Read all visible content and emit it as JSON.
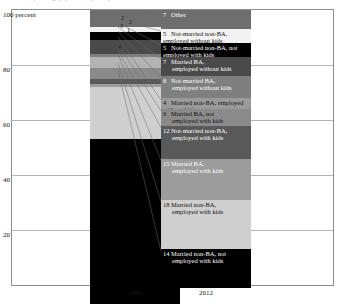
{
  "title_cropped": "Share of prime-age population, by family and work status",
  "axis": {
    "y_top_label": "100 percent",
    "y_ticks": [
      {
        "value": 100,
        "label": "100 percent"
      },
      {
        "value": 80,
        "label": "80"
      },
      {
        "value": 60,
        "label": "60"
      },
      {
        "value": 40,
        "label": "40"
      },
      {
        "value": 20,
        "label": "20"
      }
    ],
    "x_categories": [
      "1960",
      "2012"
    ]
  },
  "colors": {
    "black": "#000000",
    "dark_gray": "#3f3f3f",
    "mid_dark_gray": "#595959",
    "mid_gray": "#6e6e6e",
    "gray": "#8a8a8a",
    "light_gray": "#b3b3b3",
    "lighter_gray": "#c8c8c8",
    "pale_gray": "#d6d6d6",
    "white": "#f2f2f2",
    "frame": "#8d8d8d",
    "grid": "#b6b6b6",
    "leader": "#6b6b6b"
  },
  "chart_data": {
    "type": "bar",
    "subtype": "stacked-100-percent",
    "title": "Share of prime-age population, by family and work status",
    "xlabel": "",
    "ylabel": "percent",
    "ylim": [
      0,
      100
    ],
    "grid": true,
    "legend": "inline-labels",
    "categories": [
      "1960",
      "2012"
    ],
    "series": [
      {
        "name": "Other",
        "values": [
          6,
          7
        ]
      },
      {
        "name": "Not-married non-BA, employed without kids",
        "values": [
          2,
          5
        ]
      },
      {
        "name": "Not-married non-BA, not employed with kids",
        "values": [
          3,
          5
        ]
      },
      {
        "name": "Married BA, employed without kids",
        "values": [
          5,
          7
        ]
      },
      {
        "name": "Not-married BA, employed without kids",
        "values": [
          1,
          8
        ]
      },
      {
        "name": "Married non-BA, employed without kids",
        "values": [
          4,
          4
        ]
      },
      {
        "name": "Married BA, not employed with kids",
        "values": [
          4,
          6
        ]
      },
      {
        "name": "Not-married non-BA, employed with kids",
        "values": [
          2,
          12
        ]
      },
      {
        "name": "Married BA, employed with kids",
        "values": [
          1,
          15
        ]
      },
      {
        "name": "Married non-BA, employed with kids",
        "values": [
          19,
          18
        ]
      },
      {
        "name": "Married non-BA, not employed with kids",
        "values": [
          60,
          14
        ]
      }
    ]
  },
  "bars": {
    "b1960": {
      "year": "1960",
      "segments": [
        {
          "id": "other-1960",
          "value": 6,
          "label": "6",
          "color": "#6e6e6e"
        },
        {
          "id": "nm-nonba-emp-nokids-1960",
          "value": 2,
          "label": "2",
          "color": "#f2f2f2"
        },
        {
          "id": "nm-nonba-notemp-kids-1960",
          "value": 3,
          "label": "3",
          "color": "#000000"
        },
        {
          "id": "m-ba-emp-nokids-1960",
          "value": 5,
          "label": "5",
          "color": "#4a4a4a"
        },
        {
          "id": "nm-ba-emp-nokids-1960",
          "value": 1,
          "label": "1",
          "color": "#7f7f7f"
        },
        {
          "id": "m-nonba-emp-nokids-1960",
          "value": 4,
          "label": "4",
          "color": "#b3b3b3"
        },
        {
          "id": "m-ba-notemp-kids-1960",
          "value": 4,
          "label": "4",
          "color": "#8a8a8a"
        },
        {
          "id": "nm-nonba-emp-kids-1960",
          "value": 2,
          "label": "2",
          "color": "#595959"
        },
        {
          "id": "m-ba-emp-kids-1960",
          "value": 1,
          "label": "",
          "color": "#9c9c9c"
        },
        {
          "id": "m-nonba-emp-kids-1960",
          "value": 19,
          "label": "19",
          "color": "#cfcfcf"
        },
        {
          "id": "m-nonba-notemp-kids-1960",
          "value": 60,
          "label": "60",
          "color": "#000000"
        }
      ]
    },
    "b2012": {
      "year": "2012",
      "segments": [
        {
          "id": "other-2012",
          "value": 7,
          "num": "7",
          "text": "Other",
          "text2": "",
          "color": "#6e6e6e",
          "fg": "#ffffff"
        },
        {
          "id": "nm-nonba-emp-nokids-2012",
          "value": 5,
          "num": "5",
          "text": "Not-married non-BA, employed without kids",
          "text2": "",
          "color": "#f2f2f2",
          "fg": "#111111"
        },
        {
          "id": "nm-nonba-notemp-kids-2012",
          "value": 5,
          "num": "5",
          "text": "Not-married non-BA, not employed with kids",
          "text2": "",
          "color": "#000000",
          "fg": "#ffffff"
        },
        {
          "id": "m-ba-emp-nokids-2012",
          "value": 7,
          "num": "7",
          "text": "Married BA,",
          "text2": "employed without kids",
          "color": "#4a4a4a",
          "fg": "#ffffff"
        },
        {
          "id": "nm-ba-emp-nokids-2012",
          "value": 8,
          "num": "8",
          "text": "Not-married BA,",
          "text2": "employed without kids",
          "color": "#7f7f7f",
          "fg": "#ffffff"
        },
        {
          "id": "m-nonba-emp-nokids-2012",
          "value": 4,
          "num": "4",
          "text": "Married non-BA, employed without kids",
          "text2": "",
          "color": "#9a9a9a",
          "fg": "#111111"
        },
        {
          "id": "m-ba-notemp-kids-2012",
          "value": 6,
          "num": "6",
          "text": "Married BA, not",
          "text2": "employed with kids",
          "color": "#8a8a8a",
          "fg": "#111111"
        },
        {
          "id": "nm-nonba-emp-kids-2012",
          "value": 12,
          "num": "12",
          "text": "Not-married non-BA,",
          "text2": "employed with kids",
          "color": "#595959",
          "fg": "#ffffff"
        },
        {
          "id": "m-ba-emp-kids-2012",
          "value": 15,
          "num": "15",
          "text": "Married BA,",
          "text2": "employed with kids",
          "color": "#9c9c9c",
          "fg": "#ffffff"
        },
        {
          "id": "m-nonba-emp-kids-2012",
          "value": 18,
          "num": "18",
          "text": "Married non-BA,",
          "text2": "employed with kids",
          "color": "#cfcfcf",
          "fg": "#111111"
        },
        {
          "id": "m-nonba-notemp-kids-2012",
          "value": 14,
          "num": "14",
          "text": "Married non-BA, not",
          "text2": "employed with kids",
          "color": "#000000",
          "fg": "#ffffff"
        }
      ]
    }
  }
}
